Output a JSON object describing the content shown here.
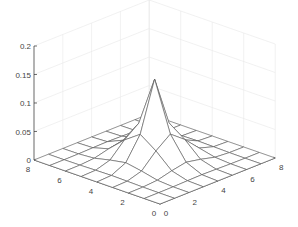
{
  "chart_data": {
    "type": "surface",
    "title": "",
    "xlabel": "",
    "ylabel": "",
    "zlabel": "",
    "x": [
      0,
      1,
      2,
      3,
      4,
      5,
      6,
      7,
      8
    ],
    "y": [
      0,
      1,
      2,
      3,
      4,
      5,
      6,
      7,
      8
    ],
    "z_formula": "pyramid peak at (4,4), max ~0.14, ~0 at edges",
    "peak": {
      "x": 4,
      "y": 4,
      "z": 0.14
    },
    "xlim": [
      0,
      8
    ],
    "ylim": [
      0,
      8
    ],
    "zlim": [
      0,
      0.2
    ],
    "xticks": [
      "0",
      "2",
      "4",
      "6",
      "8"
    ],
    "yticks": [
      "0",
      "2",
      "4",
      "6",
      "8"
    ],
    "zticks": [
      "0",
      "0.05",
      "0.1",
      "0.15",
      "0.2"
    ],
    "grid": true,
    "colors": {
      "mesh": "#555555",
      "grid": "#e8e8e8",
      "axis": "#333333",
      "face": "#ffffff"
    }
  }
}
